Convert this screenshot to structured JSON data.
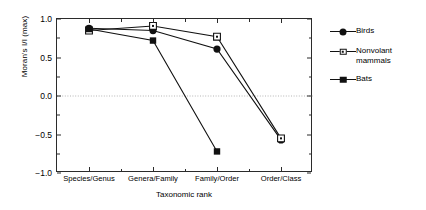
{
  "chart_data": {
    "type": "line",
    "title": "",
    "xlabel": "Taxonomic rank",
    "ylabel": "Moran's I/I (max)",
    "categories": [
      "Species/Genus",
      "Genera/Family",
      "Family/Order",
      "Order/Class"
    ],
    "ylim": [
      -1.0,
      1.0
    ],
    "yticks": [
      "1.0",
      "0.5",
      "0.0",
      "-0.5",
      "-1.0"
    ],
    "ytick_values": [
      1.0,
      0.5,
      0.0,
      -0.5,
      -1.0
    ],
    "grid": false,
    "reference_line": {
      "y": 0.0,
      "style": "dotted",
      "color": "#b5b5b5"
    },
    "legend_position": "right-outside",
    "series": [
      {
        "name": "Birds",
        "marker": "filled-circle",
        "color": "#111111",
        "values": [
          0.88,
          0.85,
          0.61,
          -0.57
        ]
      },
      {
        "name": "Nonvolant\nmammals",
        "marker": "open-square-dot",
        "color": "#111111",
        "values": [
          0.85,
          0.91,
          0.77,
          -0.55
        ]
      },
      {
        "name": "Bats",
        "marker": "filled-square",
        "color": "#111111",
        "values": [
          0.87,
          0.72,
          -0.72,
          null
        ]
      }
    ]
  },
  "legend": {
    "items": [
      {
        "label": "Birds",
        "marker": "filled-circle"
      },
      {
        "label": "Nonvolant\nmammals",
        "marker": "open-square-dot"
      },
      {
        "label": "Bats",
        "marker": "filled-square"
      }
    ]
  }
}
